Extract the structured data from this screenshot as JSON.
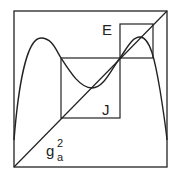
{
  "diagram": {
    "labels": {
      "E": "E",
      "J": "J",
      "g_base": "g",
      "g_sup": "2",
      "g_sub": "a"
    },
    "stroke_color": "#222222",
    "background": "#ffffff"
  }
}
